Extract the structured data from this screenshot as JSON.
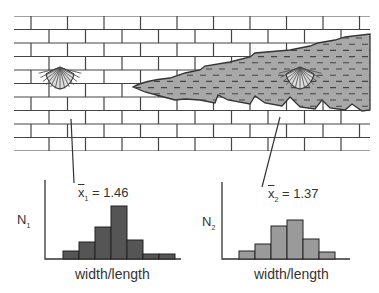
{
  "diagram": {
    "colors": {
      "brick_line": "#444444",
      "wedge_fill": "#a8a8a8",
      "wedge_dash": "#444444",
      "hist1_fill": "#555555",
      "hist2_fill": "#9a9a9a",
      "axis": "#333333"
    },
    "fossils": [
      {
        "name": "fossil-limestone",
        "facies": "limestone"
      },
      {
        "name": "fossil-shale",
        "facies": "shale"
      }
    ]
  },
  "chart_data": [
    {
      "type": "bar",
      "title": "",
      "ylabel": "N",
      "ylabel_sub": "1",
      "xlabel": "width/length",
      "mean_symbol": "x",
      "mean_sub": "1",
      "mean_value": "1.46",
      "categories": [
        "bin1",
        "bin2",
        "bin3",
        "bin4",
        "bin5",
        "bin6",
        "bin7"
      ],
      "values": [
        8,
        17,
        32,
        53,
        19,
        5,
        5
      ],
      "grid": false
    },
    {
      "type": "bar",
      "title": "",
      "ylabel": "N",
      "ylabel_sub": "2",
      "xlabel": "width/length",
      "mean_symbol": "x",
      "mean_sub": "2",
      "mean_value": "1.37",
      "categories": [
        "bin1",
        "bin2",
        "bin3",
        "bin4",
        "bin5",
        "bin6"
      ],
      "values": [
        8,
        15,
        33,
        39,
        20,
        7
      ],
      "grid": false
    }
  ],
  "labels": {
    "h1_mean_sym": "x",
    "h1_mean_sub": "1",
    "h1_mean_eq": " = 1.46",
    "h1_ylabel": "N",
    "h1_ylabel_sub": "1",
    "h1_xlabel": "width/length",
    "h2_mean_sym": "x",
    "h2_mean_sub": "2",
    "h2_mean_eq": " = 1.37",
    "h2_ylabel": "N",
    "h2_ylabel_sub": "2",
    "h2_xlabel": "width/length"
  }
}
